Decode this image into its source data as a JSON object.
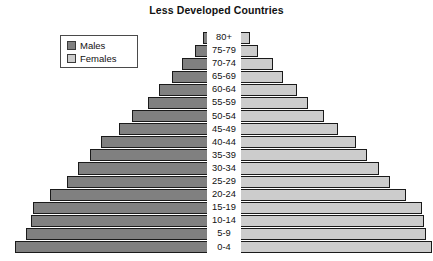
{
  "chart": {
    "title": "Less Developed Countries"
  },
  "legend": {
    "position": "top-left",
    "items": [
      {
        "label": "Males",
        "color": "#808080",
        "icon": "square-swatch-icon"
      },
      {
        "label": "Females",
        "color": "#cccccc",
        "icon": "square-swatch-icon"
      }
    ]
  },
  "chart_data": {
    "type": "bar",
    "subtype": "population-pyramid",
    "title": "Less Developed Countries",
    "xlabel": "",
    "ylabel": "",
    "grid": false,
    "legend_position": "top-left",
    "orientation": "horizontal-diverging",
    "categories": [
      "80+",
      "75-79",
      "70-74",
      "65-69",
      "60-64",
      "55-59",
      "50-54",
      "45-49",
      "40-44",
      "35-39",
      "30-34",
      "25-29",
      "20-24",
      "15-19",
      "10-14",
      "5-9",
      "0-4"
    ],
    "series": [
      {
        "name": "Males",
        "color": "#808080",
        "side": "left",
        "values": [
          8,
          16,
          29,
          39,
          52,
          63,
          79,
          92,
          110,
          121,
          133,
          144,
          161,
          178,
          180,
          185,
          196
        ]
      },
      {
        "name": "Females",
        "color": "#cccccc",
        "side": "right",
        "values": [
          14,
          22,
          37,
          47,
          61,
          72,
          88,
          102,
          120,
          131,
          143,
          154,
          170,
          186,
          188,
          190,
          196
        ]
      }
    ],
    "units": "relative bar length (px)",
    "note": "Broad-based pyramid: each younger cohort is larger than the one above it."
  }
}
